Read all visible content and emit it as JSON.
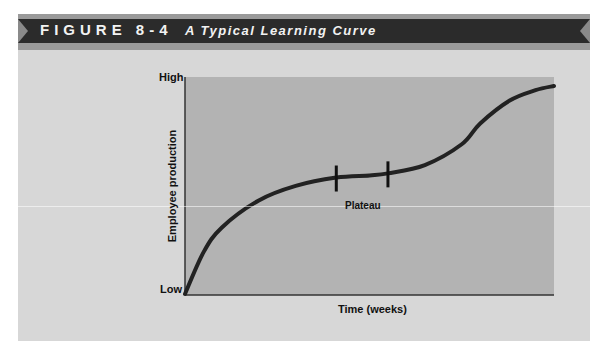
{
  "figure": {
    "label": "FIGURE 8-4",
    "title": "A Typical Learning Curve"
  },
  "colors": {
    "panel_background": "#d7d7d7",
    "plot_background": "#b3b3b3",
    "banner": "#2b2b2b",
    "banner_stripe": "#9a9a9a",
    "curve": "#222222",
    "text": "#111111"
  },
  "chart_data": {
    "type": "line",
    "title": "A Typical Learning Curve",
    "xlabel": "Time (weeks)",
    "ylabel": "Employee production",
    "y_tick_labels": [
      "Low",
      "High"
    ],
    "x_tick_labels": [],
    "grid": false,
    "legend": null,
    "xlim": [
      0,
      100
    ],
    "ylim": [
      0,
      100
    ],
    "series": [
      {
        "name": "Learning curve",
        "x": [
          0,
          5,
          10,
          20,
          30,
          41,
          50,
          55,
          65,
          75,
          80,
          88,
          95,
          100
        ],
        "y": [
          0,
          20,
          32,
          45,
          52,
          56,
          57,
          58,
          62,
          72,
          82,
          93,
          98,
          100
        ]
      }
    ],
    "annotations": [
      {
        "text": "Plateau",
        "type": "range-markers",
        "x_start": 41,
        "x_end": 55
      }
    ]
  },
  "plot": {
    "y_high": "High",
    "y_low": "Low",
    "y_axis_label": "Employee production",
    "x_axis_label": "Time (weeks)",
    "plateau_label": "Plateau"
  }
}
